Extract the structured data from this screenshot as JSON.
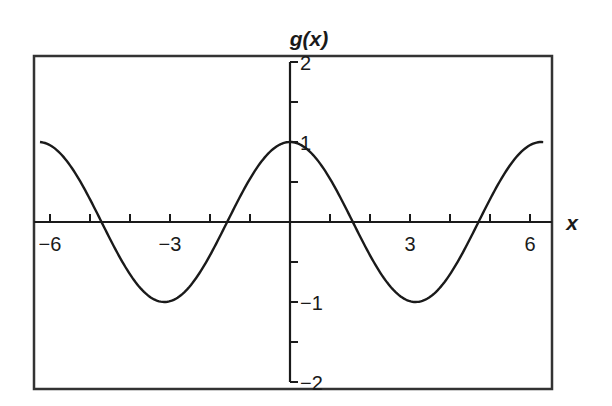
{
  "chart_data": {
    "type": "line",
    "title": "g(x)",
    "xlabel": "x",
    "ylabel": "g(x)",
    "function": "cos(x)",
    "xlim": [
      -6.4,
      6.6
    ],
    "ylim": [
      -2.1,
      2.1
    ],
    "x_ticks": [
      -6,
      -5,
      -4,
      -3,
      -2,
      -1,
      1,
      2,
      3,
      4,
      5,
      6
    ],
    "x_tick_labels": [
      {
        "value": -6,
        "label": "−6"
      },
      {
        "value": -3,
        "label": "−3"
      },
      {
        "value": 3,
        "label": "3"
      },
      {
        "value": 6,
        "label": "6"
      }
    ],
    "y_ticks": [
      -2,
      -1.5,
      -1,
      -0.5,
      0.5,
      1,
      1.5,
      2
    ],
    "y_tick_labels": [
      {
        "value": 2,
        "label": "2"
      },
      {
        "value": 1,
        "label": "1"
      },
      {
        "value": -1,
        "label": "−1"
      },
      {
        "value": -2,
        "label": "−2"
      }
    ],
    "grid": false,
    "legend": null,
    "series": [
      {
        "name": "g(x)",
        "x_range": [
          -6.25,
          6.33
        ],
        "points": [
          [
            -6.25,
            1.0
          ],
          [
            -5.5,
            0.71
          ],
          [
            -5,
            0.28
          ],
          [
            -4.71,
            0.0
          ],
          [
            -4,
            -0.65
          ],
          [
            -3.5,
            -0.94
          ],
          [
            -3.14,
            -1.0
          ],
          [
            -2.5,
            -0.8
          ],
          [
            -2,
            -0.42
          ],
          [
            -1.57,
            0.0
          ],
          [
            -1,
            0.54
          ],
          [
            -0.5,
            0.88
          ],
          [
            0,
            1.0
          ],
          [
            0.5,
            0.88
          ],
          [
            1,
            0.54
          ],
          [
            1.57,
            0.0
          ],
          [
            2,
            -0.42
          ],
          [
            2.5,
            -0.8
          ],
          [
            3.14,
            -1.0
          ],
          [
            3.5,
            -0.94
          ],
          [
            4,
            -0.65
          ],
          [
            4.71,
            0.0
          ],
          [
            5,
            0.28
          ],
          [
            5.5,
            0.71
          ],
          [
            6,
            0.96
          ],
          [
            6.33,
            1.0
          ]
        ]
      }
    ]
  },
  "layout": {
    "origin_px": [
      290,
      222
    ],
    "px_per_x_unit": 40,
    "px_per_y_unit": 80,
    "frame": {
      "left": 34,
      "top": 56,
      "right": 552,
      "bottom": 389
    }
  },
  "colors": {
    "line": "#1a1a1a",
    "frame": "#333333",
    "background": "#ffffff"
  }
}
